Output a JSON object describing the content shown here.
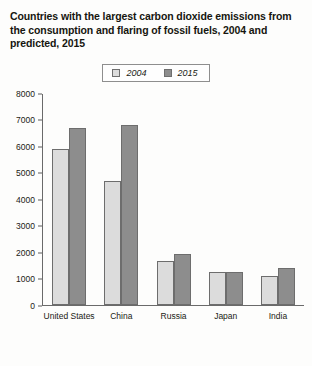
{
  "chart_data": {
    "type": "bar",
    "title": "Countries with the largest carbon dioxide emissions from the consumption and flaring of fossil fuels, 2004 and predicted, 2015",
    "xlabel": "",
    "ylabel": "",
    "ylim": [
      0,
      8000
    ],
    "yticks": [
      0,
      1000,
      2000,
      3000,
      4000,
      5000,
      6000,
      7000,
      8000
    ],
    "ytick_labels": [
      "0",
      "1000",
      "2000",
      "3000",
      "4000",
      "5000",
      "6000",
      "7000",
      "8000"
    ],
    "grid": false,
    "legend_position": "top-center",
    "categories": [
      "United States",
      "China",
      "Russia",
      "Japan",
      "India"
    ],
    "series": [
      {
        "name": "2004",
        "color": "#dcdcdc",
        "values": [
          5900,
          4700,
          1650,
          1220,
          1100
        ]
      },
      {
        "name": "2015",
        "color": "#8d8d8d",
        "values": [
          6700,
          6800,
          1900,
          1250,
          1400
        ]
      }
    ]
  }
}
